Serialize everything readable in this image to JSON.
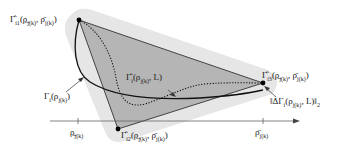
{
  "diagram": {
    "vertices": {
      "top": {
        "label": "Γ̂_i1(ρ_j(k), ρ̄_j(k))",
        "text": "Γ̂",
        "sub": "i1",
        "args": "(ρ̲",
        "args_sub": "j(k)",
        "args2": ", ρ̄",
        "args2_sub": "j(k)",
        "close": ")"
      },
      "right": {
        "label": "Γ̂_i3(ρ_j(k), ρ̄_j(k))",
        "text": "Γ̂",
        "sub": "i3",
        "args": "(ρ̲",
        "args_sub": "j(k)",
        "args2": ", ρ̄",
        "args2_sub": "j(k)",
        "close": ")"
      },
      "bottom": {
        "label": "Γ̂_i2(ρ_j(k), ρ̄_j(k))",
        "text": "Γ̂",
        "sub": "i2",
        "args": "(ρ̲",
        "args_sub": "j(k)",
        "args2": ", ρ̄",
        "args2_sub": "j(k)",
        "close": ")"
      }
    },
    "curves": {
      "true_curve": {
        "text": "Γ",
        "sub": "i",
        "args": "(ρ",
        "args_sub": "j(k)",
        "close": ")"
      },
      "approx_curve": {
        "text": "Γ̂",
        "sub": "i",
        "args": "(ρ",
        "args_sub": "j(k)",
        "args2": ", L)"
      }
    },
    "error_label": {
      "prefix": "‖ΔΓ",
      "sub": "i",
      "args": "(ρ",
      "args_sub": "j(k)",
      "args2": ", L)‖",
      "norm_sub": "2"
    },
    "axis": {
      "lower_tick": {
        "text": "ρ̲",
        "sub": "j(k)"
      },
      "upper_tick": {
        "text": "ρ̄",
        "sub": "j(k)"
      }
    },
    "colors": {
      "outer_hull": "#e6e6e6",
      "triangle_fill": "#b3b3b3",
      "line": "#1a1a1a",
      "axis": "#555555"
    }
  }
}
